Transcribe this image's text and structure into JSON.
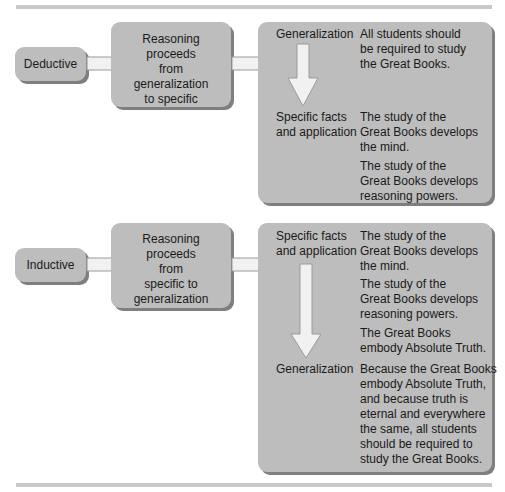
{
  "deductive": {
    "label": "Deductive",
    "process": [
      "Reasoning",
      "proceeds",
      "from",
      "generalization",
      "to specific"
    ],
    "steps": [
      {
        "term": [
          "Generalization"
        ],
        "statements": [
          [
            "All students should",
            "be required to study",
            "the Great Books."
          ]
        ]
      },
      {
        "term": [
          "Specific facts",
          "and application"
        ],
        "statements": [
          [
            "The study of the",
            "Great Books develops",
            "the mind."
          ],
          [
            "The study of the",
            "Great Books develops",
            "reasoning powers."
          ]
        ]
      }
    ]
  },
  "inductive": {
    "label": "Inductive",
    "process": [
      "Reasoning",
      "proceeds",
      "from",
      "specific to",
      "generalization"
    ],
    "steps": [
      {
        "term": [
          "Specific facts",
          "and application"
        ],
        "statements": [
          [
            "The study of the",
            "Great Books develops",
            "the mind."
          ],
          [
            "The study of the",
            "Great Books develops",
            "reasoning powers."
          ],
          [
            "The Great Books",
            "embody Absolute Truth."
          ]
        ]
      },
      {
        "term": [
          "Generalization"
        ],
        "statements": [
          [
            "Because the Great Books",
            "embody Absolute Truth,",
            "and because truth is",
            "eternal and everywhere",
            "the same, all students",
            "should be required to",
            "study the Great Books."
          ]
        ]
      }
    ]
  },
  "colors": {
    "box_fill": "#bdbdbd",
    "box_shadow": "#7f7f7f",
    "arrow_fill": "#f1f1f1",
    "rule": "#c9c9c9"
  }
}
